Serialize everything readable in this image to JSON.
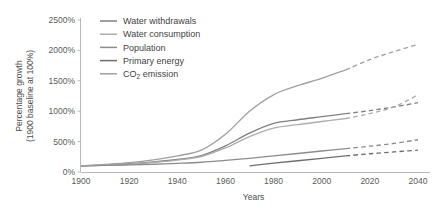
{
  "chart_data": {
    "type": "line",
    "title": "",
    "xlabel": "Years",
    "ylabel": "Percentage growth\n(1900 baseline at 100%)",
    "ylabel_line1": "Percentage growth",
    "ylabel_line2": "(1900 baseline at 100%)",
    "xlim": [
      1900,
      2040
    ],
    "ylim": [
      0,
      2500
    ],
    "xticks": [
      1900,
      1920,
      1940,
      1960,
      1980,
      2000,
      2020,
      2040
    ],
    "xtick_labels": [
      "1900",
      "1920",
      "1940",
      "1960",
      "1980",
      "2000",
      "2020",
      "2040"
    ],
    "yticks": [
      0,
      500,
      1000,
      1500,
      2000,
      2500
    ],
    "ytick_labels": [
      "0%",
      "500%",
      "1000%",
      "1500%",
      "2000%",
      "2500%"
    ],
    "grid": false,
    "legend_position": "upper-left-inside",
    "projection_note": "Solid segments are historical through ~2010; dashed segments are projections to 2040",
    "series": [
      {
        "name": "Water withdrawals",
        "color": "#808080",
        "solid_until": 2010,
        "x": [
          1900,
          1910,
          1920,
          1930,
          1940,
          1950,
          1960,
          1970,
          1980,
          1990,
          2000,
          2010,
          2020,
          2030,
          2040
        ],
        "values": [
          100,
          115,
          135,
          165,
          205,
          270,
          430,
          640,
          800,
          860,
          910,
          960,
          1010,
          1070,
          1140
        ]
      },
      {
        "name": "Water consumption",
        "color": "#adadad",
        "solid_until": 2010,
        "x": [
          1900,
          1910,
          1920,
          1930,
          1940,
          1950,
          1960,
          1970,
          1980,
          1990,
          2000,
          2010,
          2020,
          2030,
          2040
        ],
        "values": [
          100,
          112,
          130,
          158,
          195,
          255,
          395,
          580,
          720,
          780,
          830,
          880,
          960,
          1070,
          1270
        ]
      },
      {
        "name": "Population",
        "color": "#8c8c8c",
        "solid_until": 2010,
        "x": [
          1900,
          1910,
          1920,
          1930,
          1940,
          1950,
          1960,
          1970,
          1980,
          1990,
          2000,
          2010,
          2020,
          2030,
          2040
        ],
        "values": [
          100,
          108,
          116,
          128,
          142,
          160,
          190,
          225,
          265,
          305,
          345,
          385,
          425,
          470,
          530
        ]
      },
      {
        "name": "Primary energy",
        "color": "#6e6e6e",
        "solid_from": 1970,
        "solid_until": 2010,
        "x": [
          1970,
          1980,
          1990,
          2000,
          2010,
          2020,
          2030,
          2040
        ],
        "values": [
          100,
          145,
          185,
          225,
          265,
          300,
          330,
          360
        ]
      },
      {
        "name": "CO2 emission",
        "label_main": "CO",
        "label_sub": "2",
        "label_tail": " emission",
        "color": "#a0a0a0",
        "solid_until": 2010,
        "x": [
          1900,
          1910,
          1920,
          1930,
          1940,
          1950,
          1960,
          1970,
          1980,
          1990,
          2000,
          2010,
          2020,
          2030,
          2040
        ],
        "values": [
          100,
          125,
          155,
          200,
          265,
          360,
          620,
          1000,
          1270,
          1420,
          1540,
          1680,
          1850,
          1980,
          2100
        ]
      }
    ]
  }
}
